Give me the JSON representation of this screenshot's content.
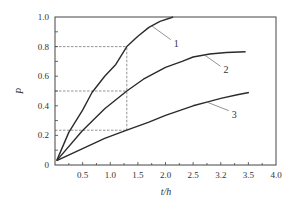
{
  "chart_data": {
    "type": "line",
    "title": "",
    "xlabel": "t/h",
    "ylabel": "P",
    "xlim": [
      0,
      4.0
    ],
    "ylim": [
      0,
      1.0
    ],
    "x_tick_values": [
      0.5,
      1.0,
      1.5,
      2.0,
      2.5,
      3.0,
      3.5,
      4.0
    ],
    "x_tick_labels": [
      "0.5",
      "1.0",
      "1.5",
      "2.0",
      "2.5",
      "3.2",
      "3.5",
      "4.0"
    ],
    "y_tick_values": [
      0,
      0.2,
      0.4,
      0.6,
      0.8,
      1.0
    ],
    "y_tick_labels": [
      "0",
      "0.2",
      "0.4",
      "0.6",
      "0.8",
      "1.0"
    ],
    "x_minor_step": 0.25,
    "y_minor_step": 0.1,
    "grid": false,
    "legend": "inline curve labels",
    "series": [
      {
        "name": "1",
        "x": [
          0.03,
          0.25,
          0.5,
          0.67,
          0.9,
          1.1,
          1.3,
          1.5,
          1.7,
          1.9,
          2.14
        ],
        "y": [
          0.03,
          0.22,
          0.37,
          0.49,
          0.6,
          0.68,
          0.8,
          0.87,
          0.93,
          0.97,
          1.0
        ],
        "label_pos": {
          "x": 2.15,
          "y": 0.82
        },
        "leader_from": {
          "x": 1.75,
          "y": 0.94
        }
      },
      {
        "name": "2",
        "x": [
          0.03,
          0.49,
          0.9,
          1.3,
          1.6,
          2.0,
          2.3,
          2.5,
          2.8,
          3.1,
          3.45
        ],
        "y": [
          0.03,
          0.23,
          0.38,
          0.5,
          0.58,
          0.66,
          0.7,
          0.73,
          0.75,
          0.76,
          0.765
        ],
        "label_pos": {
          "x": 3.05,
          "y": 0.64
        },
        "leader_from": {
          "x": 2.7,
          "y": 0.745
        }
      },
      {
        "name": "3",
        "x": [
          0.03,
          0.5,
          0.9,
          1.3,
          1.7,
          2.0,
          2.5,
          2.8,
          3.0,
          3.3,
          3.51
        ],
        "y": [
          0.03,
          0.11,
          0.18,
          0.235,
          0.29,
          0.335,
          0.4,
          0.43,
          0.45,
          0.475,
          0.49
        ],
        "label_pos": {
          "x": 3.2,
          "y": 0.34
        },
        "leader_from": {
          "x": 2.75,
          "y": 0.425
        }
      }
    ],
    "annotations": [
      {
        "type": "dashed-horizontal",
        "y": 0.8,
        "x_from": 0,
        "x_to": 1.3
      },
      {
        "type": "dashed-horizontal",
        "y": 0.5,
        "x_from": 0,
        "x_to": 1.3
      },
      {
        "type": "dashed-horizontal",
        "y": 0.235,
        "x_from": 0,
        "x_to": 1.3
      },
      {
        "type": "dashed-vertical",
        "x": 1.3,
        "y_from": 0.235,
        "y_to": 0.8
      }
    ],
    "colors": {
      "curve": "#2b2b2b",
      "axis": "#444444",
      "dashed": "#666666"
    }
  }
}
